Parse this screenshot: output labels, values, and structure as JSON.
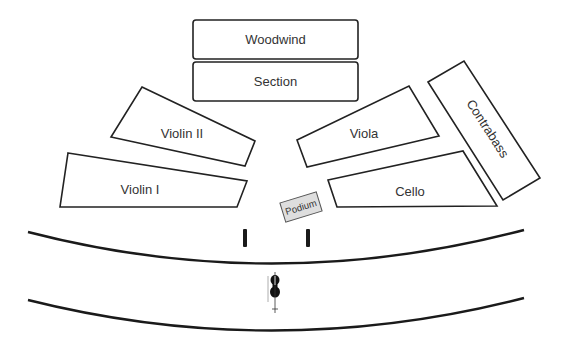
{
  "diagram": {
    "type": "orchestra-seating-chart",
    "sections": {
      "woodwind": {
        "label": "Woodwind"
      },
      "section": {
        "label": "Section"
      },
      "violin_ii": {
        "label": "Violin II"
      },
      "violin_i": {
        "label": "Violin I"
      },
      "viola": {
        "label": "Viola"
      },
      "cello": {
        "label": "Cello"
      },
      "contrabass": {
        "label": "Contrabass"
      }
    },
    "podium": {
      "label": "Podium"
    },
    "stage_edges": [
      "upper-arc",
      "lower-arc"
    ],
    "music_stands": 2,
    "soloist_icon": "cello-icon"
  }
}
